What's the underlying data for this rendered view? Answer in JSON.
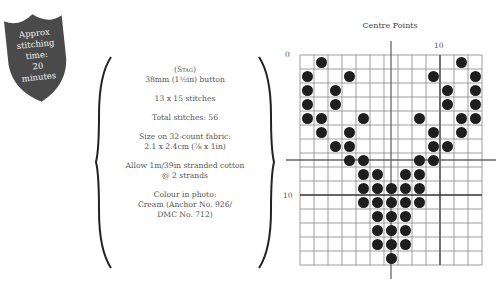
{
  "badge": {
    "lines": [
      "Approx",
      "stitching",
      "time:",
      "20",
      "minutes"
    ],
    "color": "#4a4a4a"
  },
  "info": {
    "motif": "(Stag)",
    "button_size": "38mm (1½in) button",
    "stitch_dims": "13 x 15 stitches",
    "total_stitches": "Total stitches: 56",
    "fabric_size_label": "Size on 32-count fabric:",
    "fabric_size_value": "2.1 x 2.4cm (⁷⁄₈ x 1in)",
    "thread_line1": "Allow 1m/39in stranded cotton",
    "thread_line2": "@ 2 strands",
    "colour_label": "Colour in photo:",
    "colour_line1": "Cream (Anchor No. 926/",
    "colour_line2": "DMC No. 712)"
  },
  "chart": {
    "title": "Centre Points",
    "label_origin": "0",
    "label_col10": "10",
    "label_row10": "10",
    "columns": 13,
    "rows": 15,
    "center_col": 6,
    "center_row": 7,
    "dot_color": "#1e1e1e"
  },
  "chart_data": {
    "type": "heatmap",
    "title": "Centre Points",
    "xlabel": "",
    "ylabel": "",
    "grid": true,
    "columns": 13,
    "rows": 15,
    "tick_labels": {
      "x": {
        "10": "10"
      },
      "y": {
        "0": "0",
        "10": "10"
      }
    },
    "center_lines": {
      "col": 6,
      "row": 7
    },
    "filled_cells_by_row": [
      [
        1,
        11
      ],
      [
        0,
        3,
        9,
        12
      ],
      [
        0,
        2,
        10,
        12
      ],
      [
        0,
        2,
        10,
        12
      ],
      [
        0,
        1,
        4,
        8,
        11,
        12
      ],
      [
        1,
        3,
        9,
        11
      ],
      [
        2,
        3,
        9,
        10
      ],
      [
        3,
        4,
        8,
        9
      ],
      [
        4,
        5,
        7,
        8
      ],
      [
        4,
        5,
        6,
        7,
        8
      ],
      [
        4,
        5,
        6,
        7,
        8
      ],
      [
        5,
        6,
        7
      ],
      [
        5,
        6,
        7
      ],
      [
        5,
        6,
        7
      ],
      [
        6
      ]
    ],
    "total_filled": 56
  }
}
